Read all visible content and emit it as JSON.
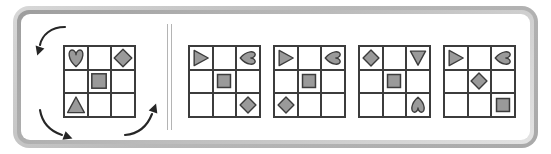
{
  "puzzle": {
    "title": "Matrix rotation reasoning item",
    "instruction_text": "",
    "frame_color": "#b9b9b9",
    "grid_line_color": "#3c3c3c",
    "shape_fill": "#9a9a9a",
    "shape_stroke": "#3c3c3c",
    "background": "#ffffff"
  },
  "problem": {
    "label": "problem-grid",
    "rows": 3,
    "columns": 3,
    "cells": [
      {
        "row": 0,
        "col": 0,
        "shape": "heart",
        "rotation": 0
      },
      {
        "row": 0,
        "col": 1,
        "shape": "empty",
        "rotation": 0
      },
      {
        "row": 0,
        "col": 2,
        "shape": "diamond",
        "rotation": 0
      },
      {
        "row": 1,
        "col": 0,
        "shape": "empty",
        "rotation": 0
      },
      {
        "row": 1,
        "col": 1,
        "shape": "square",
        "rotation": 0
      },
      {
        "row": 1,
        "col": 2,
        "shape": "empty",
        "rotation": 0
      },
      {
        "row": 2,
        "col": 0,
        "shape": "triangle",
        "rotation": 0
      },
      {
        "row": 2,
        "col": 1,
        "shape": "empty",
        "rotation": 0
      },
      {
        "row": 2,
        "col": 2,
        "shape": "empty",
        "rotation": 0
      }
    ],
    "arrows": [
      {
        "name": "rotation-arrow-top-left",
        "direction": "clockwise",
        "position": "top-left"
      },
      {
        "name": "rotation-arrow-bottom-left",
        "direction": "clockwise",
        "position": "bottom-left"
      },
      {
        "name": "rotation-arrow-bottom-right",
        "direction": "clockwise",
        "position": "bottom-right"
      }
    ]
  },
  "options": [
    {
      "index": 1,
      "label": "option-1",
      "cells": [
        {
          "row": 0,
          "col": 0,
          "shape": "triangle",
          "rotation": 90
        },
        {
          "row": 0,
          "col": 1,
          "shape": "empty",
          "rotation": 0
        },
        {
          "row": 0,
          "col": 2,
          "shape": "heart",
          "rotation": 90
        },
        {
          "row": 1,
          "col": 0,
          "shape": "empty",
          "rotation": 0
        },
        {
          "row": 1,
          "col": 1,
          "shape": "square",
          "rotation": 0
        },
        {
          "row": 1,
          "col": 2,
          "shape": "empty",
          "rotation": 0
        },
        {
          "row": 2,
          "col": 0,
          "shape": "empty",
          "rotation": 0
        },
        {
          "row": 2,
          "col": 1,
          "shape": "empty",
          "rotation": 0
        },
        {
          "row": 2,
          "col": 2,
          "shape": "diamond",
          "rotation": 0
        }
      ]
    },
    {
      "index": 2,
      "label": "option-2",
      "cells": [
        {
          "row": 0,
          "col": 0,
          "shape": "triangle",
          "rotation": 90
        },
        {
          "row": 0,
          "col": 1,
          "shape": "empty",
          "rotation": 0
        },
        {
          "row": 0,
          "col": 2,
          "shape": "heart",
          "rotation": 90
        },
        {
          "row": 1,
          "col": 0,
          "shape": "empty",
          "rotation": 0
        },
        {
          "row": 1,
          "col": 1,
          "shape": "square",
          "rotation": 0
        },
        {
          "row": 1,
          "col": 2,
          "shape": "empty",
          "rotation": 0
        },
        {
          "row": 2,
          "col": 0,
          "shape": "diamond",
          "rotation": 0
        },
        {
          "row": 2,
          "col": 1,
          "shape": "empty",
          "rotation": 0
        },
        {
          "row": 2,
          "col": 2,
          "shape": "empty",
          "rotation": 0
        }
      ]
    },
    {
      "index": 3,
      "label": "option-3",
      "cells": [
        {
          "row": 0,
          "col": 0,
          "shape": "diamond",
          "rotation": 0
        },
        {
          "row": 0,
          "col": 1,
          "shape": "empty",
          "rotation": 0
        },
        {
          "row": 0,
          "col": 2,
          "shape": "triangle",
          "rotation": 180
        },
        {
          "row": 1,
          "col": 0,
          "shape": "empty",
          "rotation": 0
        },
        {
          "row": 1,
          "col": 1,
          "shape": "square",
          "rotation": 0
        },
        {
          "row": 1,
          "col": 2,
          "shape": "empty",
          "rotation": 0
        },
        {
          "row": 2,
          "col": 0,
          "shape": "empty",
          "rotation": 0
        },
        {
          "row": 2,
          "col": 1,
          "shape": "empty",
          "rotation": 0
        },
        {
          "row": 2,
          "col": 2,
          "shape": "heart",
          "rotation": 180
        }
      ]
    },
    {
      "index": 4,
      "label": "option-4",
      "cells": [
        {
          "row": 0,
          "col": 0,
          "shape": "triangle",
          "rotation": 90
        },
        {
          "row": 0,
          "col": 1,
          "shape": "empty",
          "rotation": 0
        },
        {
          "row": 0,
          "col": 2,
          "shape": "heart",
          "rotation": 90
        },
        {
          "row": 1,
          "col": 0,
          "shape": "empty",
          "rotation": 0
        },
        {
          "row": 1,
          "col": 1,
          "shape": "diamond",
          "rotation": 0
        },
        {
          "row": 1,
          "col": 2,
          "shape": "empty",
          "rotation": 0
        },
        {
          "row": 2,
          "col": 0,
          "shape": "empty",
          "rotation": 0
        },
        {
          "row": 2,
          "col": 1,
          "shape": "empty",
          "rotation": 0
        },
        {
          "row": 2,
          "col": 2,
          "shape": "square",
          "rotation": 0
        }
      ]
    }
  ]
}
